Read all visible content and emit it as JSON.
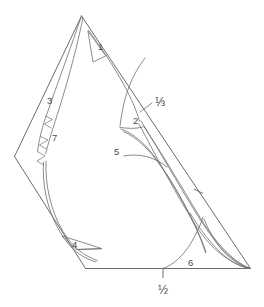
{
  "figure": {
    "background_color": "#ffffff",
    "stroke_color": "#5a5a5a",
    "label_color": "#4a4a4a",
    "width": 264,
    "height": 307
  },
  "labels": {
    "piece_1": "1",
    "piece_2": "2",
    "piece_3": "3",
    "piece_4": "4",
    "piece_5": "5",
    "piece_6": "6",
    "piece_7": "7",
    "scale_third": "⅓",
    "scale_half": "½"
  },
  "label_positions": {
    "piece_1": {
      "x": 98,
      "y": 50
    },
    "piece_2": {
      "x": 133,
      "y": 124
    },
    "piece_3": {
      "x": 47,
      "y": 104
    },
    "piece_4": {
      "x": 72,
      "y": 248
    },
    "piece_5": {
      "x": 114,
      "y": 155
    },
    "piece_6": {
      "x": 188,
      "y": 266
    },
    "piece_7": {
      "x": 52,
      "y": 141
    },
    "scale_third": {
      "x": 155,
      "y": 106
    },
    "scale_half": {
      "x": 163,
      "y": 294
    }
  },
  "annotations": {
    "leader_lines": [
      "third-leader",
      "five-leader",
      "four-leader"
    ],
    "break_marks": [
      "zigzag-upper",
      "zigzag-lower"
    ],
    "tick_marks": [
      "baseline-center-tick",
      "right-edge-tick"
    ]
  }
}
